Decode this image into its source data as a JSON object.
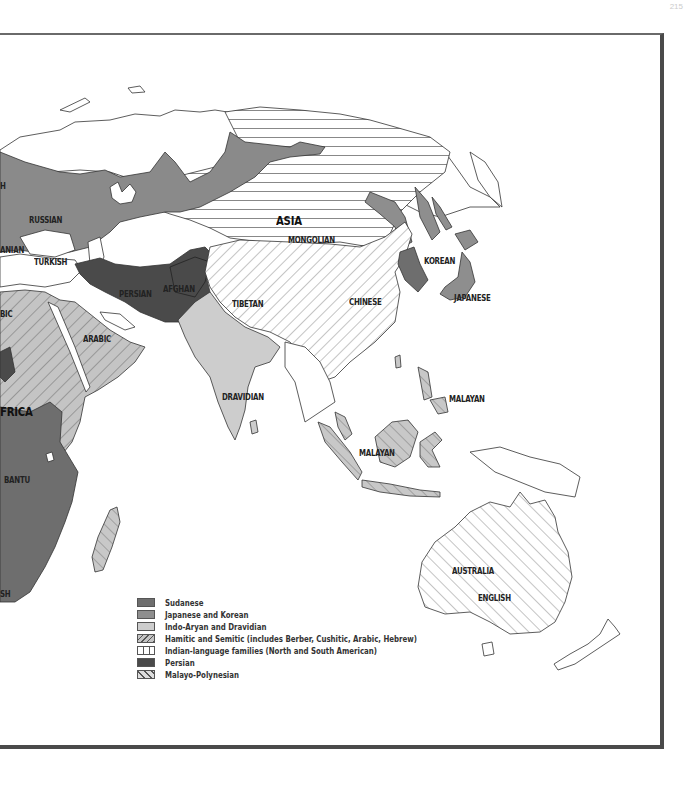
{
  "page": {
    "number": "215"
  },
  "colors": {
    "sudanese": "#6e6e6e",
    "japanese_korean": "#8e8e8e",
    "indo_aryan_dravidian": "#cdcdcd",
    "hamitic_semitic_fill": "#c4c4c4",
    "persian": "#4a4a4a",
    "russian": "#8a8a8a",
    "water": "#ffffff",
    "border": "#333333",
    "frame": "#4a4a4a"
  },
  "map": {
    "labels": {
      "russian": "RUSSIAN",
      "asia": "ASIA",
      "mongolian": "MONGOLIAN",
      "korean": "KOREAN",
      "japanese": "JAPANESE",
      "turkish": "TURKISH",
      "iranian": "ANIAN",
      "persian": "PERSIAN",
      "afghan": "AFGHAN",
      "tibetan": "TIBETAN",
      "chinese": "CHINESE",
      "arabic_west": "BIC",
      "arabic": "ARABIC",
      "dravidian": "DRAVIDIAN",
      "malayan_north": "MALAYAN",
      "malayan_south": "MALAYAN",
      "africa": "FRICA",
      "bantu": "BANTU",
      "bushman": "SH",
      "australia": "AUSTRALIA",
      "english": "ENGLISH",
      "finnish": "H"
    }
  },
  "legend": {
    "items": [
      {
        "label": "Sudanese",
        "pattern": "solid-dark"
      },
      {
        "label": "Japanese and Korean",
        "pattern": "solid-medium"
      },
      {
        "label": "Indo-Aryan and Dravidian",
        "pattern": "solid-light"
      },
      {
        "label": "Hamitic and Semitic (includes Berber, Cushitic, Arabic, Hebrew)",
        "pattern": "diagonal-forward-hatch"
      },
      {
        "label": "Indian-language families (North and South American)",
        "pattern": "vertical-lines"
      },
      {
        "label": "Persian",
        "pattern": "solid-darkest"
      },
      {
        "label": "Malayo-Polynesian",
        "pattern": "diagonal-back-hatch"
      }
    ]
  }
}
